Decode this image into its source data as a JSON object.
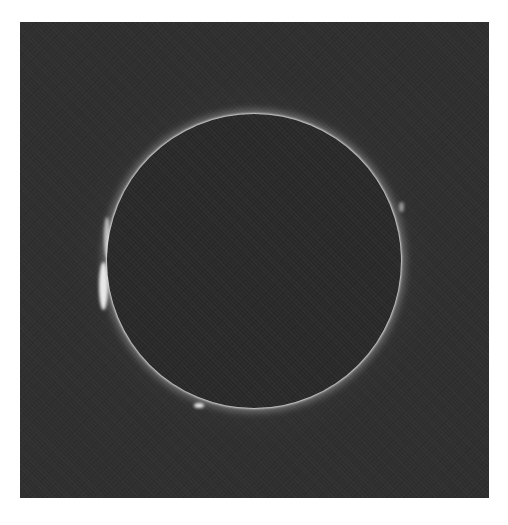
{
  "image": {
    "subject": "total-solar-eclipse",
    "elements": [
      "dark-sky-background",
      "moon-disc",
      "solar-corona",
      "solar-prominences"
    ],
    "colors": {
      "page_background": "#ffffff",
      "sky": "#2f2f2f",
      "moon": "#2a2a2a",
      "corona": "#ffffff"
    }
  }
}
